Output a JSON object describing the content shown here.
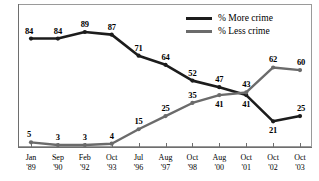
{
  "chart_data": {
    "type": "line",
    "title": "",
    "subtitle": "",
    "xlabel": "",
    "ylabel": "",
    "ylim": [
      0,
      100
    ],
    "grid": false,
    "legend_position": "top-center",
    "categories": [
      "Jan '89",
      "Sep '90",
      "Feb '92",
      "Oct '93",
      "Jul '96",
      "Aug '97",
      "Oct '98",
      "Aug '00",
      "Oct '01",
      "Oct '02",
      "Oct '03"
    ],
    "x_tick_months": [
      "Jan",
      "Sep",
      "Feb",
      "Oct",
      "Jul",
      "Aug",
      "Oct",
      "Aug",
      "Oct",
      "Oct",
      "Oct"
    ],
    "x_tick_years": [
      "'89",
      "'90",
      "'92",
      "'93",
      "'96",
      "'97",
      "'98",
      "'00",
      "'01",
      "'02",
      "'03"
    ],
    "series": [
      {
        "name": "% More crime",
        "color": "#1c1c1c",
        "values": [
          84,
          84,
          89,
          87,
          71,
          64,
          52,
          47,
          41,
          21,
          25
        ],
        "label_position": [
          "above",
          "above",
          "above",
          "above",
          "above",
          "above",
          "above",
          "above",
          "below",
          "below",
          "above"
        ]
      },
      {
        "name": "% Less crime",
        "color": "#6b6b6b",
        "values": [
          5,
          3,
          3,
          4,
          15,
          25,
          35,
          41,
          43,
          62,
          60
        ],
        "label_position": [
          "above",
          "above",
          "above",
          "above",
          "above",
          "above",
          "above",
          "below",
          "above",
          "above",
          "above"
        ]
      }
    ]
  },
  "legend": {
    "items": [
      {
        "label": "% More crime",
        "key": "more"
      },
      {
        "label": "% Less crime",
        "key": "less"
      }
    ]
  }
}
